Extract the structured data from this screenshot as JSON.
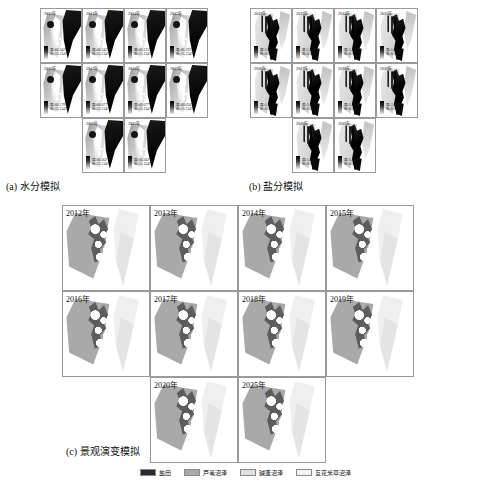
{
  "figure": {
    "panels": [
      {
        "id": "a",
        "caption": "(a) 水分模拟",
        "stat_high_label": "高",
        "stat_low_label": "低",
        "cells": [
          {
            "year": "2012年",
            "high": "高:66.342%",
            "low": "低:15.134%"
          },
          {
            "year": "2013年",
            "high": "高:66.342%",
            "low": "低:15.134%"
          },
          {
            "year": "2014年",
            "high": "高:66.235%",
            "low": "低:15.134%"
          },
          {
            "year": "2015年",
            "high": "高:66.195%",
            "low": "低:15.134%"
          },
          {
            "year": "2016年",
            "high": "高:66.179%",
            "low": "低:15.134%"
          },
          {
            "year": "2017年",
            "high": "高:66.077%",
            "low": "低:15.134%"
          },
          {
            "year": "2018年",
            "high": "高:66.077%",
            "low": "低:15.134%"
          },
          {
            "year": "2019年",
            "high": "高:66.034%",
            "low": "低:15.134%"
          },
          {
            "year": "2020年",
            "high": "高:66.562%",
            "low": "低:15.134%"
          },
          {
            "year": "2025年",
            "high": "高:66.562%",
            "low": "低:15.134%"
          }
        ]
      },
      {
        "id": "b",
        "caption": "(b) 盐分模拟",
        "stat_high_label": "高",
        "stat_low_label": "低",
        "cells": [
          {
            "year": "2012年",
            "high": "高:1.438%",
            "low": "低:0.001%"
          },
          {
            "year": "2013年",
            "high": "高:1.438%",
            "low": "低:0.001%"
          },
          {
            "year": "2014年",
            "high": "高:1.438%",
            "low": "低:0.001%"
          },
          {
            "year": "2015年",
            "high": "高:1.438%",
            "low": "低:0.001%"
          },
          {
            "year": "2016年",
            "high": "高:1.438%",
            "low": "低:0.001%"
          },
          {
            "year": "2017年",
            "high": "高:1.438%",
            "low": "低:0.001%"
          },
          {
            "year": "2018年",
            "high": "高:1.438%",
            "low": "低:0.001%"
          },
          {
            "year": "2019年",
            "high": "高:1.438%",
            "low": "低:0.001%"
          },
          {
            "year": "2020年",
            "high": "高:1.438%",
            "low": "低:0.001%"
          },
          {
            "year": "2025年",
            "high": "高:1.438%",
            "low": "低:0.001%"
          }
        ]
      },
      {
        "id": "c",
        "caption": "(c) 景观演变模拟",
        "cells": [
          {
            "year": "2012年"
          },
          {
            "year": "2013年"
          },
          {
            "year": "2014年"
          },
          {
            "year": "2015年"
          },
          {
            "year": "2016年"
          },
          {
            "year": "2017年"
          },
          {
            "year": "2018年"
          },
          {
            "year": "2019年"
          },
          {
            "year": "2020年"
          },
          {
            "year": "2025年"
          }
        ]
      }
    ],
    "legend": {
      "items": [
        {
          "label": "盐田",
          "color": "#2b2b2b"
        },
        {
          "label": "芦苇沼泽",
          "color": "#a9a9a9"
        },
        {
          "label": "碱蓬沼泽",
          "color": "#e0e0e0"
        },
        {
          "label": "互花米草沼泽",
          "color": "#f5f5f5"
        }
      ]
    }
  }
}
